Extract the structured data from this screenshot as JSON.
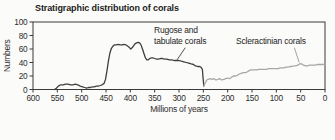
{
  "chart_data": {
    "type": "line",
    "title": "Stratigraphic distribution of corals",
    "xlabel": "Millions of years",
    "ylabel": "Numbers",
    "frame_color": "#3a3a3a",
    "background_color": "#fbfbf9",
    "x_axis": {
      "min": 0,
      "max": 600,
      "reversed": true,
      "ticks": [
        600,
        550,
        500,
        450,
        400,
        350,
        300,
        250,
        200,
        150,
        100,
        50,
        0
      ]
    },
    "y_axis": {
      "min": 0,
      "max": 100,
      "ticks": [
        0,
        20,
        40,
        60,
        80,
        100
      ]
    },
    "series": [
      {
        "id": "rugose-tabulate-corals",
        "name": "Rugose and tabulate corals",
        "color": "#3f3f3f",
        "points": [
          [
            556,
            0
          ],
          [
            552,
            2
          ],
          [
            548,
            5
          ],
          [
            543,
            7
          ],
          [
            538,
            7
          ],
          [
            533,
            8
          ],
          [
            528,
            8
          ],
          [
            523,
            7
          ],
          [
            518,
            7
          ],
          [
            513,
            8
          ],
          [
            508,
            7
          ],
          [
            503,
            5
          ],
          [
            498,
            4
          ],
          [
            494,
            3
          ],
          [
            490,
            2
          ],
          [
            486,
            3
          ],
          [
            482,
            3
          ],
          [
            478,
            4
          ],
          [
            474,
            4
          ],
          [
            470,
            5
          ],
          [
            466,
            5
          ],
          [
            462,
            6
          ],
          [
            458,
            7
          ],
          [
            454,
            9
          ],
          [
            451,
            15
          ],
          [
            448,
            28
          ],
          [
            445,
            42
          ],
          [
            442,
            54
          ],
          [
            439,
            61
          ],
          [
            436,
            64
          ],
          [
            433,
            66
          ],
          [
            429,
            66
          ],
          [
            425,
            67
          ],
          [
            421,
            66
          ],
          [
            417,
            66
          ],
          [
            413,
            67
          ],
          [
            409,
            66
          ],
          [
            405,
            64
          ],
          [
            402,
            62
          ],
          [
            399,
            60
          ],
          [
            396,
            62
          ],
          [
            393,
            65
          ],
          [
            390,
            68
          ],
          [
            387,
            69
          ],
          [
            384,
            70
          ],
          [
            381,
            69
          ],
          [
            378,
            66
          ],
          [
            375,
            60
          ],
          [
            372,
            53
          ],
          [
            369,
            47
          ],
          [
            366,
            44
          ],
          [
            363,
            44
          ],
          [
            360,
            46
          ],
          [
            357,
            47
          ],
          [
            354,
            47
          ],
          [
            350,
            46
          ],
          [
            346,
            45
          ],
          [
            342,
            45
          ],
          [
            338,
            46
          ],
          [
            334,
            46
          ],
          [
            330,
            45
          ],
          [
            325,
            45
          ],
          [
            320,
            44
          ],
          [
            315,
            44
          ],
          [
            310,
            43
          ],
          [
            305,
            43
          ],
          [
            300,
            43
          ],
          [
            295,
            42
          ],
          [
            290,
            41
          ],
          [
            285,
            40
          ],
          [
            280,
            39
          ],
          [
            275,
            38
          ],
          [
            270,
            37
          ],
          [
            266,
            35
          ],
          [
            262,
            34
          ],
          [
            258,
            34
          ],
          [
            255,
            33
          ],
          [
            252,
            30
          ],
          [
            251,
            22
          ],
          [
            249,
            5
          ]
        ]
      },
      {
        "id": "scleractinian-corals",
        "name": "Scleractinian corals",
        "color": "#a7a7a7",
        "points": [
          [
            249,
            5
          ],
          [
            246,
            10
          ],
          [
            243,
            14
          ],
          [
            240,
            15
          ],
          [
            236,
            16
          ],
          [
            232,
            15
          ],
          [
            228,
            16
          ],
          [
            224,
            14
          ],
          [
            220,
            15
          ],
          [
            216,
            16
          ],
          [
            212,
            14
          ],
          [
            208,
            15
          ],
          [
            204,
            16
          ],
          [
            200,
            17
          ],
          [
            196,
            16
          ],
          [
            192,
            18
          ],
          [
            188,
            20
          ],
          [
            184,
            20
          ],
          [
            180,
            21
          ],
          [
            176,
            23
          ],
          [
            172,
            24
          ],
          [
            168,
            25
          ],
          [
            164,
            25
          ],
          [
            160,
            26
          ],
          [
            156,
            28
          ],
          [
            152,
            29
          ],
          [
            148,
            29
          ],
          [
            144,
            29
          ],
          [
            140,
            29
          ],
          [
            136,
            30
          ],
          [
            132,
            30
          ],
          [
            128,
            30
          ],
          [
            124,
            30
          ],
          [
            120,
            30
          ],
          [
            116,
            31
          ],
          [
            112,
            31
          ],
          [
            108,
            31
          ],
          [
            104,
            31
          ],
          [
            100,
            31
          ],
          [
            96,
            31
          ],
          [
            92,
            32
          ],
          [
            88,
            32
          ],
          [
            84,
            32
          ],
          [
            80,
            33
          ],
          [
            76,
            33
          ],
          [
            72,
            34
          ],
          [
            68,
            34
          ],
          [
            64,
            35
          ],
          [
            60,
            35
          ],
          [
            56,
            36
          ],
          [
            52,
            38
          ],
          [
            48,
            38
          ],
          [
            44,
            36
          ],
          [
            40,
            35
          ],
          [
            36,
            35
          ],
          [
            32,
            36
          ],
          [
            28,
            36
          ],
          [
            24,
            36
          ],
          [
            20,
            36
          ],
          [
            16,
            37
          ],
          [
            12,
            37
          ],
          [
            8,
            37
          ],
          [
            4,
            37
          ],
          [
            0,
            38
          ]
        ]
      }
    ],
    "annotations": [
      {
        "id": "rugose-tabulate",
        "label": "Rugose and tabulate corals",
        "line1": "Rugose and",
        "line2": "tabulate corals",
        "color": "#3f3f3f",
        "leader_from": [
          287,
          62
        ],
        "leader_to": [
          304,
          44
        ]
      },
      {
        "id": "scleractinian",
        "label": "Scleractinian corals",
        "color": "#9a9a9a",
        "leader_from": [
          63,
          62
        ],
        "leader_to": [
          53,
          40
        ]
      }
    ]
  }
}
